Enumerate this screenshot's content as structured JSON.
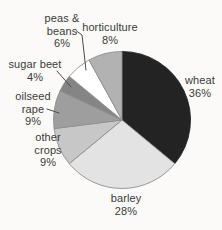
{
  "figure": {
    "background_color": "#fbfaf8",
    "text_color": "#3a3a3a"
  },
  "chart_data": {
    "type": "pie",
    "title": "",
    "unit": "%",
    "direction": "clockwise",
    "start_angle_deg": 0,
    "legend_position": "none",
    "label_style": "outside labels with percentages, leader lines for small slices",
    "slices": [
      {
        "name": "wheat",
        "value": 36,
        "pct_label": "36%",
        "lines": [
          "wheat"
        ],
        "color": "#232323"
      },
      {
        "name": "barley",
        "value": 28,
        "pct_label": "28%",
        "lines": [
          "barley"
        ],
        "color": "#e3e3e3"
      },
      {
        "name": "other crops",
        "value": 9,
        "pct_label": "9%",
        "lines": [
          "other",
          "crops"
        ],
        "color": "#c7c7c7"
      },
      {
        "name": "oilseed rape",
        "value": 9,
        "pct_label": "9%",
        "lines": [
          "oilseed",
          "rape"
        ],
        "color": "#9e9e9e"
      },
      {
        "name": "sugar beet",
        "value": 4,
        "pct_label": "4%",
        "lines": [
          "sugar beet"
        ],
        "color": "#858585"
      },
      {
        "name": "peas & beans",
        "value": 6,
        "pct_label": "6%",
        "lines": [
          "peas &",
          "beans"
        ],
        "color": "#ffffff"
      },
      {
        "name": "horticulture",
        "value": 8,
        "pct_label": "8%",
        "lines": [
          "horticulture"
        ],
        "color": "#b2b2b2"
      }
    ],
    "geometry": {
      "cx": 122,
      "cy": 120,
      "r": 68.5
    },
    "slice_outline_color": "#8f8f8f",
    "leader_line_color": "#4a4a4a"
  }
}
